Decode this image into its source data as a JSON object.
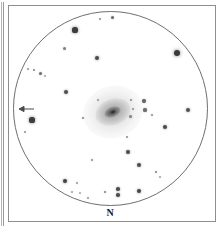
{
  "figure": {
    "kind": "telescopic-eyepiece-sketch",
    "background_color": "#ffffff",
    "frame_color": "#8e8e8e",
    "circle_color": "#6f6f6f",
    "star_color": "#333333"
  },
  "direction_label": {
    "text": "N",
    "name": "north-indicator"
  },
  "field_of_view": {
    "center_x": 110.5,
    "center_y": 108.5,
    "radius": 97
  },
  "target_object": {
    "type": "galaxy",
    "center_x": 113,
    "center_y": 112,
    "position_angle_deg": -20
  },
  "id_arrow": {
    "tip_x": 20,
    "tip_y": 109,
    "tail_x": 33,
    "tail_y": 109,
    "direction": "left"
  },
  "stars": [
    {
      "x": 100,
      "y": 19,
      "r": 1.1,
      "o": 0.55
    },
    {
      "x": 112,
      "y": 17,
      "r": 1.5,
      "o": 0.72
    },
    {
      "x": 75,
      "y": 30,
      "r": 2.6,
      "o": 0.95
    },
    {
      "x": 177,
      "y": 53,
      "r": 3.4,
      "o": 0.97
    },
    {
      "x": 64,
      "y": 48,
      "r": 1.5,
      "o": 0.62
    },
    {
      "x": 97,
      "y": 58,
      "r": 2.2,
      "o": 0.88
    },
    {
      "x": 28,
      "y": 69,
      "r": 1.1,
      "o": 0.5
    },
    {
      "x": 34,
      "y": 70,
      "r": 1.2,
      "o": 0.58
    },
    {
      "x": 40,
      "y": 73,
      "r": 1.5,
      "o": 0.7
    },
    {
      "x": 45,
      "y": 76,
      "r": 1.0,
      "o": 0.44
    },
    {
      "x": 66,
      "y": 92,
      "r": 2.0,
      "o": 0.86
    },
    {
      "x": 32,
      "y": 120,
      "r": 2.6,
      "o": 0.95
    },
    {
      "x": 25,
      "y": 132,
      "r": 1.2,
      "o": 0.52
    },
    {
      "x": 83,
      "y": 118,
      "r": 1.4,
      "o": 0.6
    },
    {
      "x": 98,
      "y": 100,
      "r": 1.2,
      "o": 0.52
    },
    {
      "x": 131,
      "y": 100,
      "r": 1.3,
      "o": 0.56
    },
    {
      "x": 133,
      "y": 109,
      "r": 1.2,
      "o": 0.54
    },
    {
      "x": 130,
      "y": 116,
      "r": 1.5,
      "o": 0.62
    },
    {
      "x": 144,
      "y": 101,
      "r": 1.7,
      "o": 0.74
    },
    {
      "x": 145,
      "y": 110,
      "r": 1.6,
      "o": 0.7
    },
    {
      "x": 152,
      "y": 115,
      "r": 1.3,
      "o": 0.56
    },
    {
      "x": 188,
      "y": 110,
      "r": 2.0,
      "o": 0.84
    },
    {
      "x": 165,
      "y": 127,
      "r": 2.1,
      "o": 0.88
    },
    {
      "x": 127,
      "y": 137,
      "r": 1.3,
      "o": 0.56
    },
    {
      "x": 128,
      "y": 152,
      "r": 2.1,
      "o": 0.88
    },
    {
      "x": 139,
      "y": 165,
      "r": 2.0,
      "o": 0.86
    },
    {
      "x": 156,
      "y": 172,
      "r": 1.4,
      "o": 0.62
    },
    {
      "x": 92,
      "y": 160,
      "r": 1.3,
      "o": 0.56
    },
    {
      "x": 65,
      "y": 181,
      "r": 2.3,
      "o": 0.92
    },
    {
      "x": 77,
      "y": 183,
      "r": 1.2,
      "o": 0.5
    },
    {
      "x": 72,
      "y": 192,
      "r": 1.1,
      "o": 0.46
    },
    {
      "x": 80,
      "y": 193,
      "r": 1.0,
      "o": 0.42
    },
    {
      "x": 88,
      "y": 198,
      "r": 1.2,
      "o": 0.5
    },
    {
      "x": 105,
      "y": 192,
      "r": 1.4,
      "o": 0.62
    },
    {
      "x": 118,
      "y": 189,
      "r": 1.8,
      "o": 0.86
    },
    {
      "x": 118,
      "y": 195,
      "r": 1.8,
      "o": 0.86
    },
    {
      "x": 139,
      "y": 191,
      "r": 2.2,
      "o": 0.9
    },
    {
      "x": 160,
      "y": 177,
      "r": 1.1,
      "o": 0.44
    }
  ]
}
